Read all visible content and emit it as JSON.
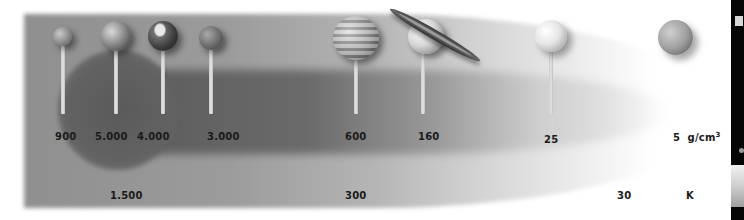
{
  "diagram": {
    "density_unit": "g/cm",
    "density_unit_superscript": "3",
    "temperature_unit": "K",
    "planets": [
      {
        "name": "Mercury",
        "icon": "mercury-icon",
        "density_label": "900"
      },
      {
        "name": "Venus",
        "icon": "venus-icon",
        "density_label": "5.000"
      },
      {
        "name": "Earth",
        "icon": "earth-icon",
        "density_label": "4.000"
      },
      {
        "name": "Mars",
        "icon": "mars-icon",
        "density_label": "3.000"
      },
      {
        "name": "Jupiter",
        "icon": "jupiter-icon",
        "density_label": "600"
      },
      {
        "name": "Saturn",
        "icon": "saturn-icon",
        "density_label": "160"
      },
      {
        "name": "Uranus",
        "icon": "uranus-icon",
        "density_label": "25"
      },
      {
        "name": "Neptune",
        "icon": "neptune-icon",
        "density_label": "5"
      }
    ],
    "temperature_labels": [
      "1.500",
      "300",
      "30"
    ],
    "colors": {
      "band_dark": "#5e5e5e",
      "band_light": "#9a9a9a",
      "text": "#1a1a1a",
      "side_panel": "#050505"
    }
  }
}
